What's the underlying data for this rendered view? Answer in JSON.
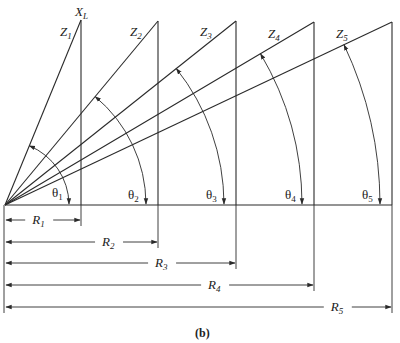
{
  "figure": {
    "caption": "(b)",
    "axis_label": {
      "base": "X",
      "sub": "L"
    },
    "origin": [
      5,
      205
    ],
    "baseline_end_x": 392,
    "triangles": [
      {
        "name": "Z",
        "index": "1",
        "theta": "1",
        "r_label": "R",
        "r_index": "1",
        "x": 81,
        "top": 20,
        "dim_y": 220
      },
      {
        "name": "Z",
        "index": "2",
        "theta": "2",
        "r_label": "R",
        "r_index": "2",
        "x": 158,
        "top": 21,
        "dim_y": 242
      },
      {
        "name": "Z",
        "index": "3",
        "theta": "3",
        "r_label": "R",
        "r_index": "3",
        "x": 236,
        "top": 21,
        "dim_y": 263
      },
      {
        "name": "Z",
        "index": "4",
        "theta": "4",
        "r_label": "R",
        "r_index": "4",
        "x": 314,
        "top": 22,
        "dim_y": 285
      },
      {
        "name": "Z",
        "index": "5",
        "theta": "5",
        "r_label": "R",
        "r_index": "5",
        "x": 392,
        "top": 22,
        "dim_y": 307
      }
    ],
    "theta_symbol": "θ"
  }
}
